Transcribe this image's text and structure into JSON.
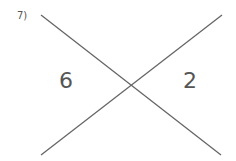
{
  "question": {
    "number_label": "7)"
  },
  "diagram": {
    "left_value": "6",
    "right_value": "2",
    "line_color": "#666666",
    "lines": [
      {
        "x1": 41,
        "y1": 15,
        "x2": 221,
        "y2": 155
      },
      {
        "x1": 222,
        "y1": 15,
        "x2": 41,
        "y2": 155
      }
    ]
  }
}
